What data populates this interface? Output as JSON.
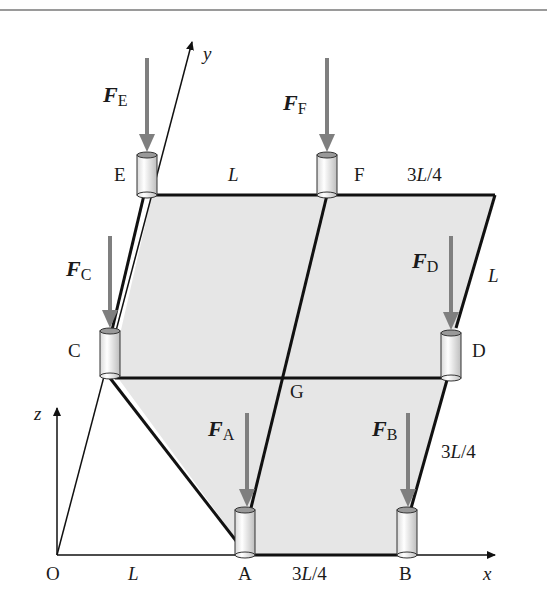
{
  "figure": {
    "colors": {
      "plate_fill": "#e6e6e6",
      "edge": "#111111",
      "force_arrow": "#7f7f7f",
      "top_rule": "#9a9a9a",
      "cylinder_fill": "#f2f2f2"
    },
    "axes": {
      "x_label": "x",
      "y_label": "y",
      "z_label": "z",
      "origin_label": "O"
    },
    "points": {
      "A": "A",
      "B": "B",
      "C": "C",
      "D": "D",
      "E": "E",
      "F": "F",
      "G": "G"
    },
    "forces": {
      "A": {
        "symbol": "F",
        "sub": "A"
      },
      "B": {
        "symbol": "F",
        "sub": "B"
      },
      "C": {
        "symbol": "F",
        "sub": "C"
      },
      "D": {
        "symbol": "F",
        "sub": "D"
      },
      "E": {
        "symbol": "F",
        "sub": "E"
      },
      "F": {
        "symbol": "F",
        "sub": "F"
      }
    },
    "dimensions": {
      "OA": {
        "pre": "",
        "var": "L",
        "post": ""
      },
      "AB": {
        "pre": "3",
        "var": "L",
        "post": "/4"
      },
      "EF": {
        "pre": "",
        "var": "L",
        "post": ""
      },
      "F_corner": {
        "pre": "3",
        "var": "L",
        "post": "/4"
      },
      "corner_D": {
        "pre": "",
        "var": "L",
        "post": ""
      },
      "D_B": {
        "pre": "3",
        "var": "L",
        "post": "/4"
      }
    }
  }
}
